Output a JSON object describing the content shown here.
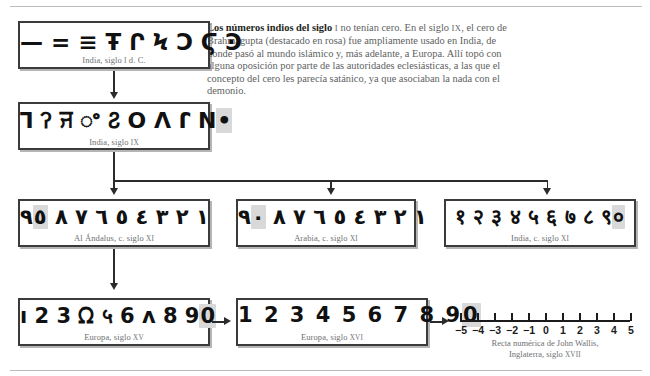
{
  "blurb": {
    "lead": "Los números indios del siglo",
    "lead_roman": "I",
    "line1_rest": " no tenían cero.",
    "body_a": "En el siglo ",
    "roman_ix": "IX",
    "body_b": ", el cero de Brahmagupta (destacado en rosa) fue ampliamente usado en India, de donde pasó al mundo islámico y, más adelante, a Europa. Allí topó con alguna oposición por parte de las autoridades eclesiásticas, a las que el concepto del cero les parecía satánico, ya que asociaban la nada con el demonio."
  },
  "boxes": [
    {
      "id": "india-siglo-i",
      "glyphs": "— = ≡ Ŧ Ր Ϟ Ͻ Ϛ Ͽ",
      "zero": "",
      "caption_main": "India, siglo ",
      "caption_roman": "I",
      "caption_tail": " d. C."
    },
    {
      "id": "india-siglo-ix",
      "glyphs": "ꓶ ꛫ ꠔ ꯦ ꛯ ꓳ ꓥ ꓩ ꓠ",
      "zero": "•",
      "caption_main": "India, siglo ",
      "caption_roman": "IX",
      "caption_tail": ""
    },
    {
      "id": "al-andalus-siglo-xi",
      "glyphs": "١ ٢ ٣ ٤ ٥ ٦ ٧ ٨ ٩",
      "zero": "٥",
      "caption_main": "Al Ándalus, c. siglo ",
      "caption_roman": "XI",
      "caption_tail": ""
    },
    {
      "id": "arabia-siglo-xi",
      "glyphs": "١ ٢ ٣ ٤ ٥ ٦ ٧ ٨ ٩",
      "zero": "٠",
      "caption_main": "Arabia, c. siglo ",
      "caption_roman": "XI",
      "caption_tail": ""
    },
    {
      "id": "india-siglo-xi",
      "glyphs": "१ २ ३ ४ ५ ६ ७ ८ ९",
      "zero": "०",
      "caption_main": "India, c. siglo ",
      "caption_roman": "XI",
      "caption_tail": ""
    },
    {
      "id": "europa-siglo-xv",
      "glyphs": "ı 2 3 ᘯ ५ 6 ᴧ 8 9",
      "zero": "0",
      "caption_main": "Europa, siglo ",
      "caption_roman": "XV",
      "caption_tail": ""
    },
    {
      "id": "europa-siglo-xvi",
      "glyphs": "1 2 3 4 5 6 7 8 9",
      "zero": "0",
      "caption_main": "Europa, siglo ",
      "caption_roman": "XVI",
      "caption_tail": ""
    }
  ],
  "numberline": {
    "ticks": [
      "−5",
      "−4",
      "−3",
      "−2",
      "−1",
      "0",
      "1",
      "2",
      "3",
      "4",
      "5"
    ],
    "caption_line1": "Recta numérica de John Wallis,",
    "caption_line2_main": "Inglaterra, siglo ",
    "caption_line2_roman": "XVII"
  },
  "colors": {
    "zero_highlight": "#d9d9d9",
    "box_border": "#3b3b3b",
    "caption_text": "#6f7073",
    "connector": "#2b2b2b"
  }
}
